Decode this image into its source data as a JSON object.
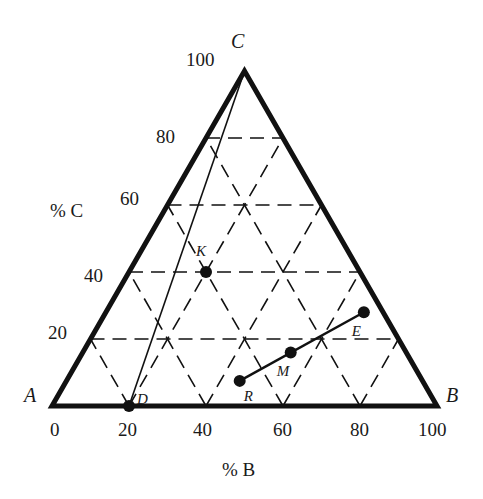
{
  "diagram": {
    "type": "ternary-phase-diagram",
    "vertices": {
      "A": {
        "label": "A",
        "x": 52,
        "y": 406
      },
      "B": {
        "label": "B",
        "x": 437,
        "y": 406
      },
      "C": {
        "label": "C",
        "x": 244.5,
        "y": 71
      }
    },
    "axes": {
      "c_label": "% C",
      "b_label": "% B",
      "c_ticks": [
        "20",
        "40",
        "60",
        "80",
        "100"
      ],
      "b_ticks": [
        "0",
        "20",
        "40",
        "60",
        "80",
        "100"
      ]
    },
    "grid": {
      "step_percent": 20,
      "style": "dashed"
    },
    "points": [
      {
        "id": "K",
        "label": "K",
        "pct_B": 20,
        "pct_C": 40
      },
      {
        "id": "D",
        "label": "D",
        "pct_B": 20,
        "pct_C": 0
      },
      {
        "id": "R",
        "label": "R",
        "pct_B": 45,
        "pct_C": 7.5
      },
      {
        "id": "M",
        "label": "M",
        "pct_B": 54,
        "pct_C": 16
      },
      {
        "id": "E",
        "label": "E",
        "pct_B": 67,
        "pct_C": 28
      }
    ],
    "lines": [
      {
        "from": "D",
        "to": "C",
        "style": "thin-solid"
      },
      {
        "from": "R",
        "to": "E",
        "style": "solid",
        "through": "M"
      }
    ],
    "colors": {
      "ink": "#111111",
      "background": "#ffffff"
    }
  }
}
